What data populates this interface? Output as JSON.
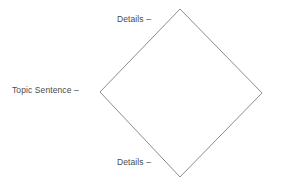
{
  "diagram": {
    "title": "",
    "background_color": "#ffffff",
    "shape": {
      "name": "diamond",
      "stroke_color": "#8c8c8c",
      "fill_color": "#ffffff",
      "stroke_width": 1,
      "vertices": {
        "top": [
          180,
          9
        ],
        "right": [
          262,
          93
        ],
        "bottom": [
          180,
          177
        ],
        "left": [
          100,
          92
        ]
      }
    },
    "labels": {
      "topic_sentence": "Topic Sentence –",
      "details_top": "Details –",
      "details_bottom": "Details –"
    }
  }
}
